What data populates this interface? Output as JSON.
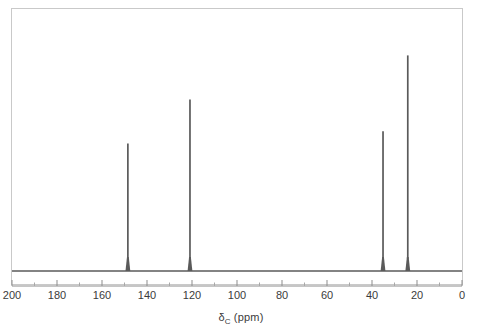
{
  "figure": {
    "name": "carbon-13-nmr-spectrum",
    "background_color": "#ffffff",
    "frame_color": "#c9c9c9",
    "trace_color": "#5a5a5a"
  },
  "axis": {
    "title_symbol": "δ",
    "title_subscript": "C",
    "title_units": "(ppm)",
    "title_full": "δC (ppm)",
    "direction": "reversed",
    "tick_labels": [
      "200",
      "180",
      "160",
      "140",
      "120",
      "100",
      "80",
      "60",
      "40",
      "20",
      "0"
    ],
    "tick_values": [
      200,
      180,
      160,
      140,
      120,
      100,
      80,
      60,
      40,
      20,
      0
    ],
    "minor_tick_values": [
      190,
      170,
      150,
      130,
      110,
      90,
      70,
      50,
      30,
      10
    ]
  },
  "chart_data": {
    "type": "line",
    "title": "",
    "subtitle": "",
    "xlabel": "δC (ppm)",
    "ylabel": "",
    "xlim": [
      200,
      0
    ],
    "ylim": [
      0,
      1
    ],
    "grid": false,
    "legend": "none",
    "x_axis_reversed": true,
    "baseline_level": 0.0,
    "peaks": [
      {
        "label": "peak-148",
        "ppm": 148.5,
        "intensity": 0.52,
        "width_ppm": 0.55
      },
      {
        "label": "peak-121",
        "ppm": 120.9,
        "intensity": 0.7,
        "width_ppm": 0.55
      },
      {
        "label": "peak-35",
        "ppm": 35.1,
        "intensity": 0.57,
        "width_ppm": 0.55
      },
      {
        "label": "peak-24",
        "ppm": 24.1,
        "intensity": 0.88,
        "width_ppm": 0.55
      }
    ]
  }
}
